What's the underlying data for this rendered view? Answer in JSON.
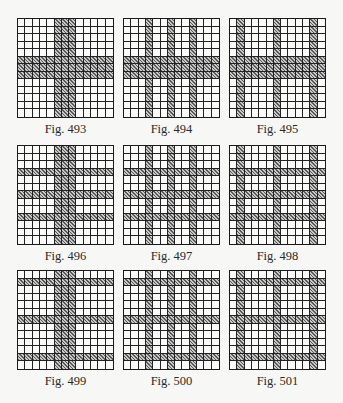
{
  "grid_size": 13,
  "figures": [
    {
      "caption": "Fig. 493",
      "hatched_cols": [
        5,
        6,
        7
      ],
      "hatched_rows": [
        5,
        6,
        7
      ]
    },
    {
      "caption": "Fig. 494",
      "hatched_cols": [
        3,
        6,
        9
      ],
      "hatched_rows": [
        5,
        6,
        7
      ]
    },
    {
      "caption": "Fig. 495",
      "hatched_cols": [
        1,
        6,
        11
      ],
      "hatched_rows": [
        5,
        6,
        7
      ]
    },
    {
      "caption": "Fig. 496",
      "hatched_cols": [
        5,
        6,
        7
      ],
      "hatched_rows": [
        3,
        6,
        9
      ]
    },
    {
      "caption": "Fig. 497",
      "hatched_cols": [
        3,
        6,
        9
      ],
      "hatched_rows": [
        3,
        6,
        9
      ]
    },
    {
      "caption": "Fig. 498",
      "hatched_cols": [
        1,
        6,
        11
      ],
      "hatched_rows": [
        3,
        6,
        9
      ]
    },
    {
      "caption": "Fig. 499",
      "hatched_cols": [
        5,
        6,
        7
      ],
      "hatched_rows": [
        1,
        6,
        11
      ]
    },
    {
      "caption": "Fig. 500",
      "hatched_cols": [
        3,
        6,
        9
      ],
      "hatched_rows": [
        1,
        6,
        11
      ]
    },
    {
      "caption": "Fig. 501",
      "hatched_cols": [
        1,
        6,
        11
      ],
      "hatched_rows": [
        1,
        6,
        11
      ]
    }
  ]
}
